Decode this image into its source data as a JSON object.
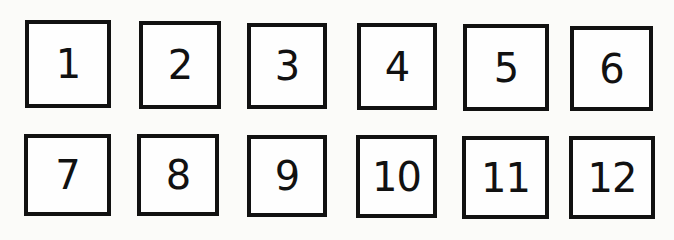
{
  "boxes": [
    {
      "label": "1"
    },
    {
      "label": "2"
    },
    {
      "label": "3"
    },
    {
      "label": "4"
    },
    {
      "label": "5"
    },
    {
      "label": "6"
    },
    {
      "label": "7"
    },
    {
      "label": "8"
    },
    {
      "label": "9"
    },
    {
      "label": "10"
    },
    {
      "label": "11"
    },
    {
      "label": "12"
    }
  ]
}
